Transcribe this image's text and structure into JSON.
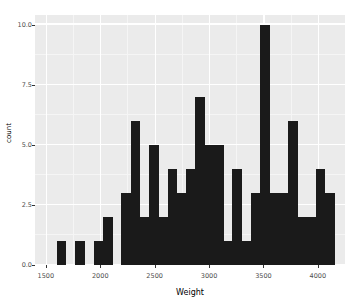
{
  "chart_data": {
    "type": "bar",
    "title": "",
    "xlabel": "Weight",
    "ylabel": "count",
    "xlim": [
      1400,
      4250
    ],
    "ylim": [
      0,
      10.4
    ],
    "grid": true,
    "legend": "none",
    "xticks": [
      "1500",
      "2000",
      "2500",
      "3000",
      "3500",
      "4000"
    ],
    "xtick_values": [
      1500,
      2000,
      2500,
      3000,
      3500,
      4000
    ],
    "yticks": [
      "0.0",
      "2.5",
      "5.0",
      "7.5",
      "10.0"
    ],
    "ytick_values": [
      0,
      2.5,
      5,
      7.5,
      10
    ],
    "bin_width": 85,
    "bin_starts": [
      1600,
      1685,
      1770,
      1855,
      1940,
      2025,
      2110,
      2195,
      2280,
      2365,
      2450,
      2535,
      2620,
      2705,
      2790,
      2875,
      2960,
      3045,
      3130,
      3215,
      3300,
      3385,
      3470,
      3555,
      3640,
      3725,
      3810,
      3895,
      3980,
      4065
    ],
    "categories": [
      "1600",
      "1685",
      "1770",
      "1855",
      "1940",
      "2025",
      "2110",
      "2195",
      "2280",
      "2365",
      "2450",
      "2535",
      "2620",
      "2705",
      "2790",
      "2875",
      "2960",
      "3045",
      "3130",
      "3215",
      "3300",
      "3385",
      "3470",
      "3555",
      "3640",
      "3725",
      "3810",
      "3895",
      "3980",
      "4065"
    ],
    "values": [
      1,
      0,
      1,
      0,
      1,
      2,
      0,
      3,
      6,
      2,
      5,
      2,
      4,
      3,
      4,
      7,
      5,
      5,
      1,
      4,
      1,
      3,
      10,
      3,
      3,
      6,
      2,
      2,
      4,
      3
    ],
    "bar_color": "#1a1a1a",
    "panel_color": "#ebebeb",
    "gridline_color": "#ffffff"
  }
}
